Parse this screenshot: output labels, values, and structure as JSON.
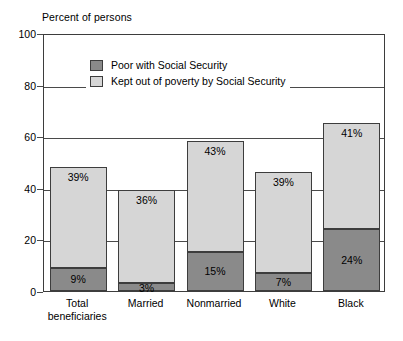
{
  "chart_data": {
    "type": "bar",
    "subtype": "stacked-bar",
    "title": "",
    "ylabel": "Percent of persons",
    "xlabel": "",
    "ylim": [
      0,
      100
    ],
    "yticks": [
      0,
      20,
      40,
      60,
      80,
      100
    ],
    "ytick_labels": [
      "0",
      "20",
      "40",
      "60",
      "80",
      "100"
    ],
    "grid": true,
    "grid_axis": "y",
    "legend_position": "upper-left-inside",
    "categories": [
      "Total beneficiaries",
      "Married",
      "Nonmarried",
      "White",
      "Black"
    ],
    "category_label_lines": [
      [
        "Total",
        "beneficiaries"
      ],
      [
        "Married",
        ""
      ],
      [
        "Nonmarried",
        ""
      ],
      [
        "White",
        ""
      ],
      [
        "Black",
        ""
      ]
    ],
    "series": [
      {
        "name": "Poor with Social Security",
        "color": "#8a8a8a",
        "values": [
          9,
          3,
          15,
          7,
          24
        ],
        "data_labels": [
          "9%",
          "3%",
          "15%",
          "7%",
          "24%"
        ]
      },
      {
        "name": "Kept out of poverty by Social Security",
        "color": "#d6d6d6",
        "values": [
          39,
          36,
          43,
          39,
          41
        ],
        "data_labels": [
          "39%",
          "36%",
          "43%",
          "39%",
          "41%"
        ]
      }
    ],
    "totals": [
      48,
      39,
      58,
      46,
      65
    ]
  },
  "colors": {
    "poor_with_ss": "#8a8a8a",
    "kept_out_of_poverty": "#d6d6d6",
    "axis": "#3d3d3d",
    "grid": "#4a4a4a",
    "background": "#ffffff",
    "text": "#000000"
  },
  "axis": {
    "title": "Percent of persons"
  },
  "legend": {
    "items": [
      {
        "label": "Poor with Social Security",
        "swatch": "dark"
      },
      {
        "label": "Kept out of poverty by Social Security",
        "swatch": "light"
      }
    ]
  },
  "yticks": [
    {
      "label": "100"
    },
    {
      "label": "80"
    },
    {
      "label": "60"
    },
    {
      "label": "40"
    },
    {
      "label": "20"
    },
    {
      "label": "0"
    }
  ],
  "bars": [
    {
      "category": "Total beneficiaries",
      "label_line1": "Total",
      "label_line2": "beneficiaries",
      "bottom_value": 9,
      "top_value": 39,
      "total": 48,
      "bottom_label": "9%",
      "top_label": "39%"
    },
    {
      "category": "Married",
      "label_line1": "Married",
      "label_line2": "",
      "bottom_value": 3,
      "top_value": 36,
      "total": 39,
      "bottom_label": "3%",
      "top_label": "36%"
    },
    {
      "category": "Nonmarried",
      "label_line1": "Nonmarried",
      "label_line2": "",
      "bottom_value": 15,
      "top_value": 43,
      "total": 58,
      "bottom_label": "15%",
      "top_label": "43%"
    },
    {
      "category": "White",
      "label_line1": "White",
      "label_line2": "",
      "bottom_value": 7,
      "top_value": 39,
      "total": 46,
      "bottom_label": "7%",
      "top_label": "39%"
    },
    {
      "category": "Black",
      "label_line1": "Black",
      "label_line2": "",
      "bottom_value": 24,
      "top_value": 41,
      "total": 65,
      "bottom_label": "24%",
      "top_label": "41%"
    }
  ]
}
